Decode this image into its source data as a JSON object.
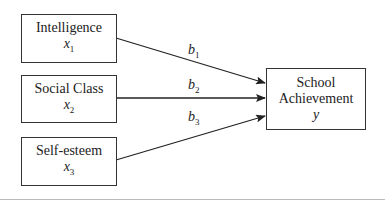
{
  "diagram": {
    "type": "path-diagram",
    "predictors": [
      {
        "label": "Intelligence",
        "var": "x",
        "sub": "1"
      },
      {
        "label": "Social Class",
        "var": "x",
        "sub": "2"
      },
      {
        "label": "Self-esteem",
        "var": "x",
        "sub": "3"
      }
    ],
    "outcome": {
      "label1": "School",
      "label2": "Achievement",
      "var": "y"
    },
    "coefficients": [
      {
        "sym": "b",
        "sub": "1"
      },
      {
        "sym": "b",
        "sub": "2"
      },
      {
        "sym": "b",
        "sub": "3"
      }
    ],
    "colors": {
      "line": "#222222",
      "background": "#ffffff"
    }
  }
}
